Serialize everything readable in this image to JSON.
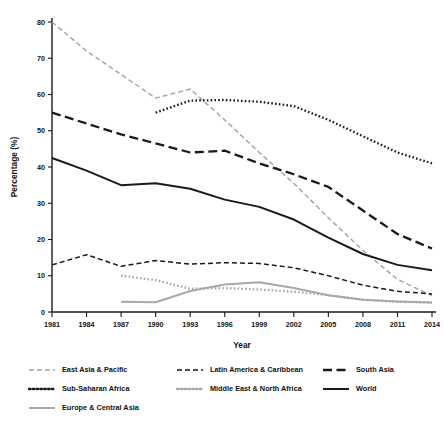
{
  "chart_data": {
    "type": "line",
    "title": "",
    "xlabel": "Year",
    "ylabel": "Percentage (%)",
    "xlim": [
      1981,
      2014
    ],
    "ylim": [
      0,
      80
    ],
    "ytick_labels": [
      "0",
      "10",
      "20",
      "30",
      "40",
      "50",
      "60",
      "70",
      "80"
    ],
    "yticks": [
      0,
      10,
      20,
      30,
      40,
      50,
      60,
      70,
      80
    ],
    "xtick_labels": [
      "1981",
      "1984",
      "1987",
      "1990",
      "1993",
      "1996",
      "1999",
      "2002",
      "2005",
      "2008",
      "2011",
      "2014"
    ],
    "xticks": [
      1981,
      1984,
      1987,
      1990,
      1993,
      1996,
      1999,
      2002,
      2005,
      2008,
      2011,
      2014
    ],
    "grid": false,
    "legend_position": "below",
    "series": [
      {
        "name": "East Asia & Pacific",
        "style": "dashed",
        "color": "#a8a8a8",
        "x": [
          1981,
          1984,
          1987,
          1990,
          1993,
          1996,
          1999,
          2002,
          2005,
          2008,
          2011,
          2014
        ],
        "values": [
          80.0,
          72.0,
          65.5,
          59.0,
          61.5,
          53.0,
          44.0,
          35.5,
          26.0,
          17.0,
          9.0,
          4.5
        ]
      },
      {
        "name": "Latin America & Caribbean",
        "style": "dashed",
        "color": "#1a1a1a",
        "x": [
          1981,
          1984,
          1987,
          1990,
          1993,
          1996,
          1999,
          2002,
          2005,
          2008,
          2011,
          2014
        ],
        "values": [
          13.0,
          15.8,
          12.6,
          14.2,
          13.2,
          13.6,
          13.4,
          12.2,
          10.0,
          7.4,
          5.7,
          5.0
        ]
      },
      {
        "name": "South Asia",
        "style": "long-dash",
        "color": "#1a1a1a",
        "x": [
          1981,
          1984,
          1987,
          1990,
          1993,
          1996,
          1999,
          2002,
          2005,
          2008,
          2011,
          2014
        ],
        "values": [
          55.0,
          52.0,
          49.0,
          46.5,
          44.0,
          44.5,
          41.0,
          38.0,
          34.5,
          28.0,
          21.5,
          17.5
        ]
      },
      {
        "name": "Sub-Saharan Africa",
        "style": "dotted",
        "color": "#1a1a1a",
        "x": [
          1990,
          1993,
          1996,
          1999,
          2002,
          2005,
          2008,
          2011,
          2014
        ],
        "values": [
          55.0,
          58.3,
          58.5,
          58.0,
          56.8,
          53.0,
          48.5,
          44.0,
          41.0
        ]
      },
      {
        "name": "Middle East & North Africa",
        "style": "dotted",
        "color": "#a8a8a8",
        "x": [
          1987,
          1990,
          1993,
          1996,
          1999,
          2002,
          2005,
          2008,
          2011,
          2014
        ],
        "values": [
          10.0,
          8.8,
          6.4,
          6.6,
          6.2,
          5.6,
          4.6,
          3.4,
          2.8,
          2.6
        ]
      },
      {
        "name": "Europe & Central Asia",
        "style": "solid",
        "color": "#a8a8a8",
        "x": [
          1987,
          1990,
          1993,
          1996,
          1999,
          2002,
          2005,
          2008,
          2011,
          2014
        ],
        "values": [
          2.8,
          2.7,
          5.8,
          7.6,
          8.2,
          6.6,
          4.6,
          3.4,
          2.9,
          2.6
        ]
      },
      {
        "name": "World",
        "style": "solid",
        "color": "#1a1a1a",
        "x": [
          1981,
          1984,
          1987,
          1990,
          1993,
          1996,
          1999,
          2002,
          2005,
          2008,
          2011,
          2014
        ],
        "values": [
          42.5,
          39.0,
          35.0,
          35.5,
          34.0,
          31.0,
          29.0,
          25.5,
          20.5,
          16.0,
          13.0,
          11.5
        ]
      }
    ]
  },
  "legend": {
    "items": [
      {
        "label": "East Asia & Pacific",
        "style": "dashed",
        "color": "#a8a8a8"
      },
      {
        "label": "Latin America & Caribbean",
        "style": "dashed",
        "color": "#1a1a1a"
      },
      {
        "label": "South Asia",
        "style": "long-dash",
        "color": "#1a1a1a"
      },
      {
        "label": "Sub-Saharan Africa",
        "style": "dotted",
        "color": "#1a1a1a"
      },
      {
        "label": "Middle East & North Africa",
        "style": "dotted",
        "color": "#a8a8a8"
      },
      {
        "label": "World",
        "style": "solid",
        "color": "#1a1a1a"
      },
      {
        "label": "Europe & Central Asia",
        "style": "solid",
        "color": "#a8a8a8"
      }
    ]
  }
}
